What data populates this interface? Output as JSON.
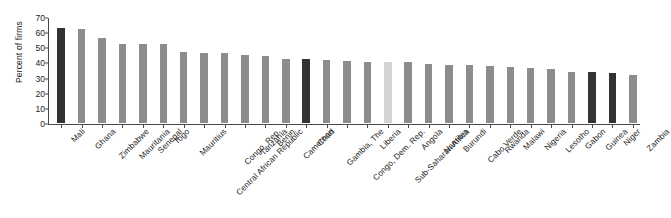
{
  "chart_data": {
    "type": "bar",
    "title": "",
    "subtitle": "",
    "xlabel": "",
    "ylabel": "Percent of firms",
    "ylim": [
      0,
      70
    ],
    "yticks": [
      0,
      10,
      20,
      30,
      40,
      50,
      60,
      70
    ],
    "grid": false,
    "legend": false,
    "categories": [
      "Mali",
      "Ghana",
      "Zimbabwe",
      "Mauritania",
      "Senegal",
      "Togo",
      "Mauritius",
      "Central African Republic",
      "Congo, Rep.",
      "Tanzania",
      "Benin",
      "Cameroon",
      "Chad",
      "Gambia, The",
      "Congo, Dem. Rep.",
      "Liberia",
      "Sub-Saharan Africa",
      "Angola",
      "Namibia",
      "Burundi",
      "Cabo Verde",
      "Rwanda",
      "Malawi",
      "Nigeria",
      "Lesotho",
      "Gabon",
      "Guinea",
      "Niger",
      "Zambia"
    ],
    "values": [
      63,
      62,
      56,
      52.5,
      52,
      52,
      47,
      46.5,
      46,
      45,
      44,
      42,
      42,
      41.5,
      41,
      40.5,
      40,
      40,
      39,
      38.5,
      38,
      37.5,
      37,
      36.5,
      36,
      34,
      33.5,
      33,
      32
    ],
    "bar_styles": [
      "highlight",
      "normal",
      "normal",
      "normal",
      "normal",
      "normal",
      "normal",
      "normal",
      "normal",
      "normal",
      "normal",
      "normal",
      "highlight",
      "normal",
      "normal",
      "normal",
      "light",
      "normal",
      "normal",
      "normal",
      "normal",
      "normal",
      "normal",
      "normal",
      "normal",
      "normal",
      "highlight",
      "highlight",
      "normal"
    ],
    "colors": {
      "bar_default": "#8c8c8c",
      "bar_highlight": "#333333",
      "bar_light": "#d4d4d4",
      "axis": "#4a4a4a",
      "text": "#1b1b1b",
      "background": "#ffffff"
    }
  }
}
